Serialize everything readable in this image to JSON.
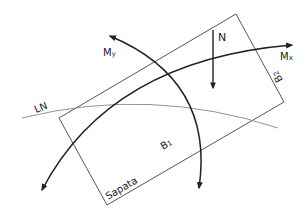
{
  "diagram": {
    "footing_label": "Sapata",
    "labels": {
      "N": "N",
      "Mx": "M",
      "Mx_sub": "x",
      "My": "M",
      "My_sub": "y",
      "LN": "LN",
      "B1": "B",
      "B1_sub": "1",
      "B2": "B",
      "B2_sub": "2"
    },
    "colors": {
      "outline": "#555555",
      "moment_curve": "#222222",
      "neutral_line": "#888888",
      "text": "#222222"
    }
  }
}
